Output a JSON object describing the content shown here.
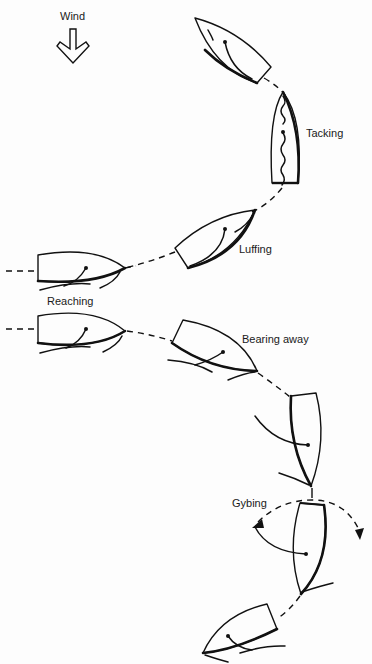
{
  "diagram": {
    "type": "sailing-manoeuvres",
    "wind": {
      "label": "Wind",
      "direction": "down",
      "icon": "down-arrow-icon"
    },
    "labels": {
      "tacking": "Tacking",
      "luffing": "Luffing",
      "reaching": "Reaching",
      "bearing_away": "Bearing away",
      "gybing": "Gybing"
    },
    "boats": [
      {
        "id": "close-hauled-port",
        "stage": "before tack"
      },
      {
        "id": "tacking",
        "stage": "Tacking",
        "sail": "flapping"
      },
      {
        "id": "luffing",
        "stage": "Luffing"
      },
      {
        "id": "reaching-1",
        "stage": "Reaching"
      },
      {
        "id": "reaching-2",
        "stage": "Reaching"
      },
      {
        "id": "bearing-away",
        "stage": "Bearing away"
      },
      {
        "id": "running",
        "stage": "before gybe"
      },
      {
        "id": "gybing",
        "stage": "Gybing"
      },
      {
        "id": "after-gybe",
        "stage": "after gybe"
      }
    ]
  }
}
